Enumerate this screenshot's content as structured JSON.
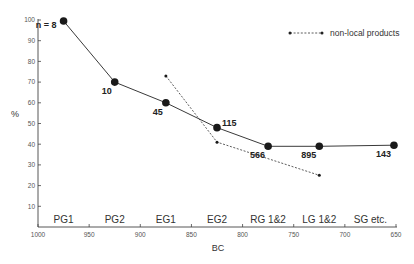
{
  "chart_data": {
    "type": "line",
    "title": "",
    "xlabel": "BC",
    "ylabel": "%",
    "xlim": [
      1000,
      650
    ],
    "ylim": [
      0,
      100
    ],
    "x_reversed": true,
    "x_ticks": [
      1000,
      950,
      900,
      850,
      800,
      750,
      700,
      650
    ],
    "y_ticks": [
      10,
      20,
      30,
      40,
      50,
      60,
      70,
      80,
      90,
      100
    ],
    "grid": false,
    "periods": [
      {
        "label": "PG1",
        "from": 1000,
        "to": 950
      },
      {
        "label": "PG2",
        "from": 950,
        "to": 900
      },
      {
        "label": "EG1",
        "from": 900,
        "to": 850
      },
      {
        "label": "EG2",
        "from": 850,
        "to": 800
      },
      {
        "label": "RG 1&2",
        "from": 800,
        "to": 750
      },
      {
        "label": "LG 1&2",
        "from": 750,
        "to": 700
      },
      {
        "label": "SG etc.",
        "from": 700,
        "to": 650
      }
    ],
    "series": [
      {
        "name": "all products",
        "style": "solid",
        "marker": "large-dot",
        "points": [
          {
            "x": 975,
            "y": 99.5,
            "label": "n = 8",
            "label_pos": "left"
          },
          {
            "x": 925,
            "y": 70,
            "label": "10",
            "label_pos": "below-left"
          },
          {
            "x": 875,
            "y": 60,
            "label": "45",
            "label_pos": "below-left"
          },
          {
            "x": 825,
            "y": 48,
            "label": "115",
            "label_pos": "above-right"
          },
          {
            "x": 775,
            "y": 39,
            "label": "566",
            "label_pos": "below-left"
          },
          {
            "x": 725,
            "y": 39,
            "label": "895",
            "label_pos": "below-left"
          },
          {
            "x": 652,
            "y": 39.5,
            "label": "143",
            "label_pos": "below-left"
          }
        ]
      },
      {
        "name": "non-local products",
        "style": "dashed",
        "marker": "small-dot",
        "points": [
          {
            "x": 875,
            "y": 73
          },
          {
            "x": 825,
            "y": 41
          },
          {
            "x": 725,
            "y": 25
          }
        ]
      }
    ],
    "legend": {
      "position": "top-right",
      "entries": [
        {
          "label": "non-local products",
          "style": "dashed"
        }
      ]
    }
  },
  "axes": {
    "xlabel": "BC",
    "ylabel": "%"
  },
  "legend": {
    "label": "non-local products"
  }
}
